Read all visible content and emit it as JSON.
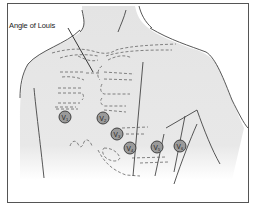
{
  "diagram": {
    "annotations": [
      {
        "id": "angle-of-louis",
        "text": "Angle of Louis"
      }
    ],
    "leads": [
      {
        "id": "V1",
        "letter": "V",
        "sub": "1",
        "cx": 65,
        "cy": 117
      },
      {
        "id": "V2",
        "letter": "V",
        "sub": "2",
        "cx": 103,
        "cy": 118
      },
      {
        "id": "V3",
        "letter": "V",
        "sub": "3",
        "cx": 117,
        "cy": 134
      },
      {
        "id": "V4",
        "letter": "V",
        "sub": "4",
        "cx": 130,
        "cy": 148
      },
      {
        "id": "V5",
        "letter": "V",
        "sub": "5",
        "cx": 157,
        "cy": 147
      },
      {
        "id": "V6",
        "letter": "V",
        "sub": "6",
        "cx": 180,
        "cy": 146
      }
    ],
    "colors": {
      "skin": "#e6e6e6",
      "outline": "#444444",
      "rib_dash": "#666666",
      "electrode_fill": "#9a9a9a",
      "electrode_stroke": "#333333",
      "frame": "#555555"
    }
  }
}
